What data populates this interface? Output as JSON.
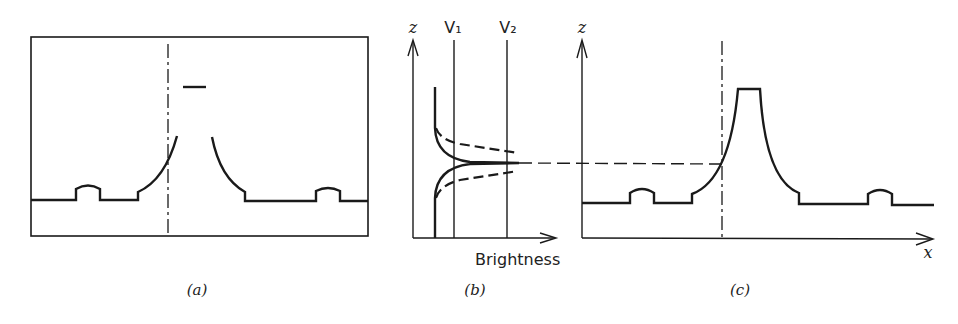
{
  "figure": {
    "panels": [
      {
        "id": "a",
        "caption": "(a)",
        "description": "Boxed image-plane view of a surface profile with two small bumps and a central peak whose top is clipped (gap), with a short bar above; vertical dashed line marks the scan position."
      },
      {
        "id": "b",
        "caption": "(b)",
        "x_axis_label": "Brightness",
        "y_axis_label": "z",
        "threshold_labels": [
          "V₁",
          "V₂"
        ],
        "description": "Brightness vs z curve (solid) with dashed neighbouring curves; thresholds V1 and V2 as vertical lines; dashed horizontal projection toward panel (c)."
      },
      {
        "id": "c",
        "caption": "(c)",
        "x_axis_label": "x",
        "y_axis_label": "z",
        "description": "Reconstructed height profile z(x): baseline with two small bumps, central flat-topped peak; dashed vertical line at scan position meets dashed projection from (b)."
      }
    ],
    "colors": {
      "ink": "#1a1a1a",
      "background": "#ffffff"
    }
  }
}
